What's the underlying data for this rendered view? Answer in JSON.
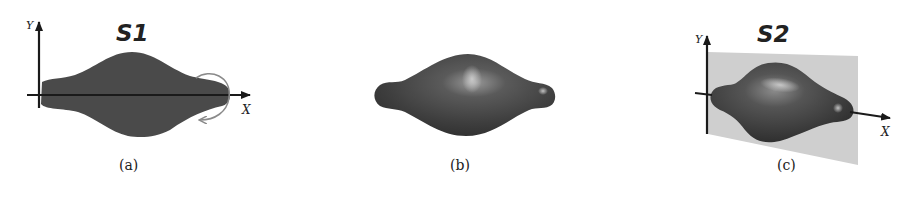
{
  "panels": [
    {
      "id": "a",
      "caption": "(a)",
      "title": "S1",
      "axis_labels": {
        "x": "X",
        "y": "Y"
      },
      "description": "2D silhouette profile lying on the X axis with rotation arrow"
    },
    {
      "id": "b",
      "caption": "(b)",
      "description": "3D surface of revolution generated from S1"
    },
    {
      "id": "c",
      "caption": "(c)",
      "title": "S2",
      "axis_labels": {
        "x": "X",
        "y": "Y"
      },
      "description": "3D shape intersected by a gray plane along X-Y"
    }
  ],
  "colors": {
    "shape_fill": "#4a4a4a",
    "axis": "#1a1a1a",
    "rotation_arrow": "#8a8a8a",
    "plane": "#cfcfcf",
    "background": "#ffffff"
  }
}
